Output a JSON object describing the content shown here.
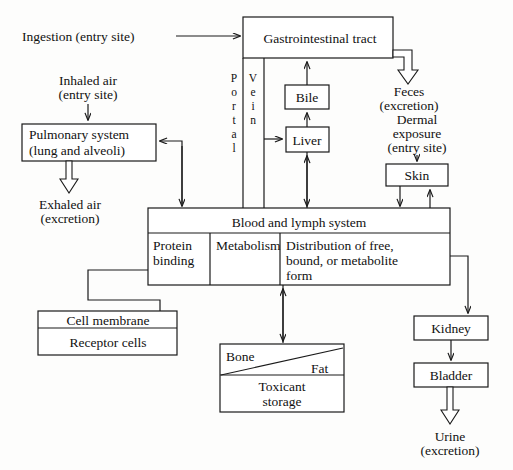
{
  "diagram": {
    "entries": {
      "ingestion": "Ingestion (entry site)",
      "inhaled_l1": "Inhaled air",
      "inhaled_l2": "(entry site)",
      "dermal_l1": "Dermal",
      "dermal_l2": "exposure",
      "dermal_l3": "(entry site)"
    },
    "excretions": {
      "feces_l1": "Feces",
      "feces_l2": "(excretion)",
      "exhaled_l1": "Exhaled air",
      "exhaled_l2": "(excretion)",
      "urine_l1": "Urine",
      "urine_l2": "(excretion)"
    },
    "boxes": {
      "gi_tract": "Gastrointestinal tract",
      "bile": "Bile",
      "liver": "Liver",
      "skin": "Skin",
      "pulmonary_l1": "Pulmonary system",
      "pulmonary_l2": "(lung and alveoli)",
      "blood": "Blood and lymph system",
      "protein_l1": "Protein",
      "protein_l2": "binding",
      "metabolism": "Metabolism",
      "distribution_l1": "Distribution of free,",
      "distribution_l2": "bound, or metabolite",
      "distribution_l3": "form",
      "cell_membrane": "Cell membrane",
      "receptor_cells": "Receptor cells",
      "bone": "Bone",
      "fat": "Fat",
      "toxicant_l1": "Toxicant",
      "toxicant_l2": "storage",
      "kidney": "Kidney",
      "bladder": "Bladder"
    },
    "labels": {
      "portal": [
        "P",
        "o",
        "r",
        "t",
        "a",
        "l"
      ],
      "vein": [
        "V",
        "e",
        "i",
        "n"
      ]
    },
    "colors": {
      "stroke": "#1a1a1a",
      "background": "#fdfdfc",
      "text": "#111111"
    }
  }
}
